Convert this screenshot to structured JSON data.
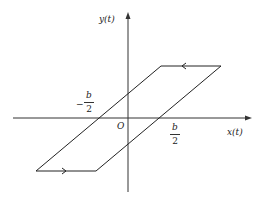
{
  "figure": {
    "type": "hysteresis-parallelogram",
    "colors": {
      "line": "#222222",
      "background": "#ffffff"
    },
    "axes": {
      "x_label": "x(t)",
      "y_label": "y(t)",
      "origin_label": "O"
    },
    "annotations": {
      "neg_half_b": {
        "sign": "−",
        "numerator": "b",
        "denominator": "2"
      },
      "pos_half_b": {
        "numerator": "b",
        "denominator": "2"
      }
    },
    "loop": {
      "vertices": [
        {
          "name": "top-left",
          "x": 161,
          "y": 66
        },
        {
          "name": "top-right",
          "x": 221,
          "y": 66
        },
        {
          "name": "bottom-right",
          "x": 96,
          "y": 171
        },
        {
          "name": "bottom-left",
          "x": 36,
          "y": 171
        }
      ],
      "top_edge_direction": "left",
      "bottom_edge_direction": "right"
    }
  }
}
